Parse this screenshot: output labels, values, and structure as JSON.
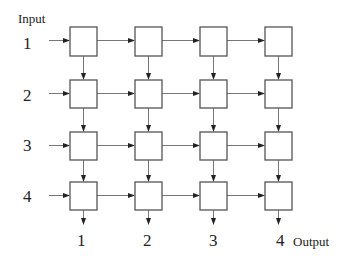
{
  "diagram": {
    "input_label": "Input",
    "output_label": "Output",
    "rows": [
      {
        "label": "1",
        "y": 27
      },
      {
        "label": "2",
        "y": 80
      },
      {
        "label": "3",
        "y": 132
      },
      {
        "label": "4",
        "y": 182
      }
    ],
    "columns": [
      {
        "label": "1",
        "x": 70
      },
      {
        "label": "2",
        "x": 135
      },
      {
        "label": "3",
        "x": 200
      },
      {
        "label": "4",
        "x": 265
      }
    ],
    "box_size": 27,
    "colors": {
      "box_stroke": "#555555",
      "line": "#777777",
      "arrow": "#222222",
      "text": "#222222"
    }
  }
}
